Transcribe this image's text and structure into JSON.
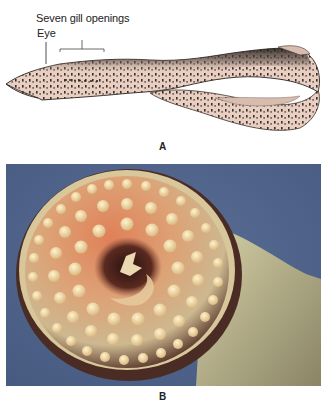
{
  "figure": {
    "panel_a": {
      "letter": "A",
      "labels": {
        "gill": "Seven gill openings",
        "eye": "Eye"
      },
      "subject": "lamprey-side-view-drawing"
    },
    "panel_b": {
      "letter": "B",
      "subject": "lamprey-oral-disc-photo"
    }
  },
  "colors": {
    "body_fill": "#e9cfc2",
    "body_dark": "#2a2420",
    "photo_background": "#4f6289",
    "disc_orange": "#d9734a",
    "teeth": "#efd9a0",
    "throat": "#3a1a14"
  }
}
